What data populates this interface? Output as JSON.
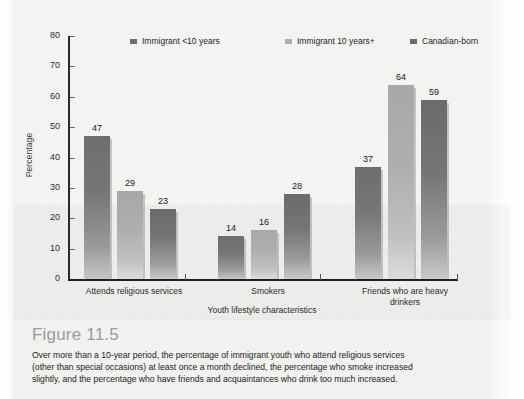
{
  "figure": {
    "heading": "Figure 11.5",
    "caption_lines": [
      "Over more than a 10-year period, the percentage of immigrant youth who attend religious services",
      "(other than special occasions) at least once a month declined, the percentage who smoke increased",
      "slightly, and the percentage who have friends and acquaintances who drink too much increased."
    ],
    "heading_color": "#9b9b9b"
  },
  "chart_data": {
    "type": "bar",
    "title": "",
    "xlabel": "Youth lifestyle characteristics",
    "ylabel": "Percentage",
    "ylim": [
      0,
      80
    ],
    "yticks": [
      0,
      10,
      20,
      30,
      40,
      50,
      60,
      70,
      80
    ],
    "grid": false,
    "legend_position": "top",
    "categories": [
      "Attends religious services",
      "Smokers",
      "Friends who are heavy drinkers"
    ],
    "series": [
      {
        "name": "Immigrant <10 years",
        "color": "#6e6e6e",
        "values": [
          47,
          14,
          37
        ]
      },
      {
        "name": "Immigrant 10 years+",
        "color": "#aeaeae",
        "values": [
          29,
          16,
          64
        ]
      },
      {
        "name": "Canadian-born",
        "color": "#6b6b6b",
        "values": [
          23,
          28,
          59
        ]
      }
    ]
  },
  "axis": {
    "ytick_labels": [
      "80",
      "70",
      "60",
      "50",
      "40",
      "30",
      "20",
      "10",
      "0"
    ],
    "xcat_lines": [
      [
        "Attends religious services"
      ],
      [
        "Smokers"
      ],
      [
        "Friends who are heavy",
        "drinkers"
      ]
    ]
  },
  "margin_text": "·····"
}
